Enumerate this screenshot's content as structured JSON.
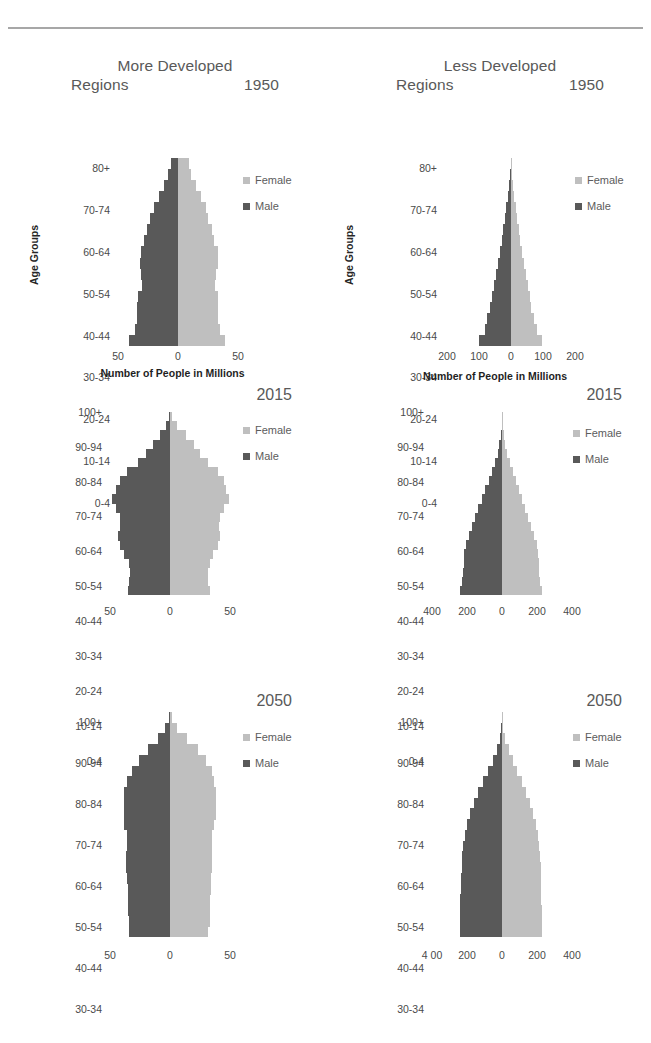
{
  "colors": {
    "male": "#595959",
    "female": "#bfbfbf",
    "text": "#4a4a4a",
    "title": "#595959",
    "rule": "#8a8a8a"
  },
  "legend": {
    "female_label": "Female",
    "male_label": "Male"
  },
  "axis_titles": {
    "y": "Age Groups",
    "x": "Number of People in Millions"
  },
  "charts": [
    {
      "id": "more-developed-1950",
      "region_title": "More Developed\nRegions",
      "year": "1950",
      "show_axis_titles": true,
      "y_labels": [
        "80+",
        "70-74",
        "60-64",
        "50-54",
        "40-44",
        "30-34",
        "20-24",
        "10-14",
        "0-4"
      ],
      "x_ticks": [
        "50",
        "0",
        "50"
      ]
    },
    {
      "id": "less-developed-1950",
      "region_title": "Less Developed\nRegions",
      "year": "1950",
      "show_axis_titles": true,
      "y_labels": [
        "80+",
        "70-74",
        "60-64",
        "50-54",
        "40-44",
        "30-34",
        "20-24",
        "10-14",
        "0-4"
      ],
      "x_ticks": [
        "200",
        "100",
        "0",
        "100",
        "200"
      ]
    },
    {
      "id": "more-developed-2015",
      "region_title": "",
      "year": "2015",
      "show_axis_titles": false,
      "y_labels": [
        "100+",
        "90-94",
        "80-84",
        "70-74",
        "60-64",
        "50-54",
        "40-44",
        "30-34",
        "20-24",
        "10-14",
        "0-4"
      ],
      "x_ticks": [
        "50",
        "0",
        "50"
      ]
    },
    {
      "id": "less-developed-2015",
      "region_title": "",
      "year": "2015",
      "show_axis_titles": false,
      "y_labels": [
        "100+",
        "90-94",
        "80-84",
        "70-74",
        "60-64",
        "50-54",
        "40-44",
        "30-34",
        "20-24",
        "10-14",
        "0-4"
      ],
      "x_ticks": [
        "400",
        "200",
        "0",
        "200",
        "400"
      ]
    },
    {
      "id": "more-developed-2050",
      "region_title": "",
      "year": "2050",
      "show_axis_titles": false,
      "y_labels": [
        "100+",
        "90-94",
        "80-84",
        "70-74",
        "60-64",
        "50-54",
        "40-44",
        "30-34",
        "20-24",
        "10-14",
        "0-4"
      ],
      "x_ticks": [
        "50",
        "0",
        "50"
      ]
    },
    {
      "id": "less-developed-2050",
      "region_title": "",
      "year": "2050",
      "show_axis_titles": false,
      "y_labels": [
        "100+",
        "90-94",
        "80-84",
        "70-74",
        "60-64",
        "50-54",
        "40-44",
        "30-34",
        "20-24",
        "10-14",
        "0-4"
      ],
      "x_ticks": [
        "4 00",
        "200",
        "0",
        "200",
        "400"
      ]
    }
  ],
  "chart_data": [
    {
      "type": "bar",
      "subtype": "population-pyramid",
      "title": "More Developed Regions 1950",
      "year": 1950,
      "region": "More Developed Regions",
      "xlabel": "Number of People in Millions",
      "ylabel": "Age Groups",
      "xlim": [
        -50,
        50
      ],
      "xticks": [
        50,
        0,
        50
      ],
      "grid": false,
      "legend": [
        "Female",
        "Male"
      ],
      "legend_position": "right",
      "categories": [
        "0-4",
        "5-9",
        "10-14",
        "15-19",
        "20-24",
        "25-29",
        "30-34",
        "35-39",
        "40-44",
        "45-49",
        "50-54",
        "55-59",
        "60-64",
        "65-69",
        "70-74",
        "75-79",
        "80+"
      ],
      "series": [
        {
          "name": "Male",
          "values": [
            41,
            36,
            34,
            34,
            33,
            30,
            31,
            32,
            31,
            28,
            26,
            23,
            20,
            16,
            12,
            8,
            6
          ]
        },
        {
          "name": "Female",
          "values": [
            39,
            35,
            33,
            33,
            33,
            31,
            32,
            33,
            33,
            30,
            28,
            25,
            23,
            19,
            15,
            11,
            9
          ]
        }
      ]
    },
    {
      "type": "bar",
      "subtype": "population-pyramid",
      "title": "Less Developed Regions 1950",
      "year": 1950,
      "region": "Less Developed Regions",
      "xlabel": "Number of People in Millions",
      "ylabel": "Age Groups",
      "xlim": [
        -250,
        250
      ],
      "xticks": [
        200,
        100,
        0,
        100,
        200
      ],
      "grid": false,
      "legend": [
        "Female",
        "Male"
      ],
      "legend_position": "right",
      "categories": [
        "0-4",
        "5-9",
        "10-14",
        "15-19",
        "20-24",
        "25-29",
        "30-34",
        "35-39",
        "40-44",
        "45-49",
        "50-54",
        "55-59",
        "60-64",
        "65-69",
        "70-74",
        "75-79",
        "80+"
      ],
      "series": [
        {
          "name": "Male",
          "values": [
            125,
            103,
            92,
            82,
            74,
            66,
            58,
            51,
            44,
            37,
            31,
            25,
            19,
            13,
            8,
            4,
            2
          ]
        },
        {
          "name": "Female",
          "values": [
            122,
            100,
            89,
            80,
            73,
            65,
            57,
            50,
            43,
            36,
            30,
            24,
            19,
            13,
            8,
            4,
            2
          ]
        }
      ]
    },
    {
      "type": "bar",
      "subtype": "population-pyramid",
      "title": "More Developed Regions 2015",
      "year": 2015,
      "region": "More Developed Regions",
      "xlabel": "",
      "ylabel": "",
      "xlim": [
        -50,
        50
      ],
      "xticks": [
        50,
        0,
        50
      ],
      "grid": false,
      "legend": [
        "Female",
        "Male"
      ],
      "legend_position": "right",
      "categories": [
        "0-4",
        "5-9",
        "10-14",
        "15-19",
        "20-24",
        "25-29",
        "30-34",
        "35-39",
        "40-44",
        "45-49",
        "50-54",
        "55-59",
        "60-64",
        "65-69",
        "70-74",
        "75-79",
        "80-84",
        "85-89",
        "90-94",
        "95-99",
        "100+"
      ],
      "series": [
        {
          "name": "Male",
          "values": [
            35,
            34,
            33,
            34,
            38,
            42,
            43,
            42,
            42,
            45,
            48,
            45,
            42,
            36,
            27,
            20,
            14,
            8,
            3,
            1,
            0
          ]
        },
        {
          "name": "Female",
          "values": [
            33,
            32,
            32,
            33,
            36,
            40,
            42,
            41,
            42,
            45,
            49,
            47,
            45,
            40,
            32,
            25,
            20,
            13,
            6,
            2,
            0
          ]
        }
      ]
    },
    {
      "type": "bar",
      "subtype": "population-pyramid",
      "title": "Less Developed Regions 2015",
      "year": 2015,
      "region": "Less Developed Regions",
      "xlabel": "",
      "ylabel": "",
      "xlim": [
        -500,
        500
      ],
      "xticks": [
        400,
        200,
        0,
        200,
        400
      ],
      "grid": false,
      "legend": [
        "Female",
        "Male"
      ],
      "legend_position": "right",
      "categories": [
        "0-4",
        "5-9",
        "10-14",
        "15-19",
        "20-24",
        "25-29",
        "30-34",
        "35-39",
        "40-44",
        "45-49",
        "50-54",
        "55-59",
        "60-64",
        "65-69",
        "70-74",
        "75-79",
        "80-84",
        "85-89",
        "90-94",
        "95-99",
        "100+"
      ],
      "series": [
        {
          "name": "Male",
          "values": [
            300,
            288,
            281,
            275,
            272,
            258,
            236,
            211,
            190,
            168,
            145,
            120,
            96,
            72,
            50,
            32,
            18,
            8,
            3,
            1,
            0
          ]
        },
        {
          "name": "Female",
          "values": [
            283,
            272,
            266,
            261,
            259,
            248,
            229,
            206,
            186,
            165,
            144,
            121,
            99,
            76,
            55,
            37,
            22,
            11,
            4,
            1,
            0
          ]
        }
      ]
    },
    {
      "type": "bar",
      "subtype": "population-pyramid",
      "title": "More Developed Regions 2050",
      "year": 2050,
      "region": "More Developed Regions",
      "xlabel": "",
      "ylabel": "",
      "xlim": [
        -50,
        50
      ],
      "xticks": [
        50,
        0,
        50
      ],
      "grid": false,
      "legend": [
        "Female",
        "Male"
      ],
      "legend_position": "right",
      "categories": [
        "0-4",
        "5-9",
        "10-14",
        "15-19",
        "20-24",
        "25-29",
        "30-34",
        "35-39",
        "40-44",
        "45-49",
        "50-54",
        "55-59",
        "60-64",
        "65-69",
        "70-74",
        "75-79",
        "80-84",
        "85-89",
        "90-94",
        "95-99",
        "100+"
      ],
      "series": [
        {
          "name": "Male",
          "values": [
            34,
            34,
            35,
            35,
            35,
            36,
            37,
            37,
            36,
            36,
            38,
            38,
            38,
            38,
            36,
            32,
            26,
            18,
            10,
            4,
            1
          ]
        },
        {
          "name": "Female",
          "values": [
            32,
            33,
            33,
            33,
            34,
            34,
            35,
            35,
            35,
            35,
            37,
            38,
            38,
            38,
            37,
            35,
            30,
            23,
            14,
            6,
            2
          ]
        }
      ]
    },
    {
      "type": "bar",
      "subtype": "population-pyramid",
      "title": "Less Developed Regions 2050",
      "year": 2050,
      "region": "Less Developed Regions",
      "xlabel": "",
      "ylabel": "",
      "xlim": [
        -500,
        500
      ],
      "xticks": [
        400,
        200,
        0,
        200,
        400
      ],
      "grid": false,
      "legend": [
        "Female",
        "Male"
      ],
      "legend_position": "right",
      "categories": [
        "0-4",
        "5-9",
        "10-14",
        "15-19",
        "20-24",
        "25-29",
        "30-34",
        "35-39",
        "40-44",
        "45-49",
        "50-54",
        "55-59",
        "60-64",
        "65-69",
        "70-74",
        "75-79",
        "80-84",
        "85-89",
        "90-94",
        "95-99",
        "100+"
      ],
      "series": [
        {
          "name": "Male",
          "values": [
            303,
            302,
            300,
            297,
            293,
            290,
            288,
            285,
            277,
            265,
            248,
            228,
            203,
            172,
            137,
            101,
            67,
            38,
            16,
            5,
            1
          ]
        },
        {
          "name": "Female",
          "values": [
            285,
            284,
            283,
            281,
            278,
            276,
            275,
            273,
            267,
            257,
            242,
            224,
            202,
            174,
            142,
            109,
            77,
            47,
            22,
            7,
            1
          ]
        }
      ]
    }
  ]
}
